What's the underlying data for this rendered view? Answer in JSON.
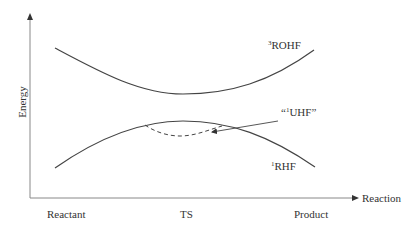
{
  "diagram": {
    "title": "",
    "y_axis": {
      "label": "Energy"
    },
    "x_axis": {
      "label": "Reaction",
      "ticks": [
        "Reactant",
        "TS",
        "Product"
      ]
    },
    "curves": [
      {
        "id": "rohf",
        "sup": "3",
        "name": "ROHF",
        "style": "solid",
        "shape": "upper curve with minimum at TS"
      },
      {
        "id": "rhf",
        "sup": "1",
        "name": "RHF",
        "style": "solid",
        "shape": "lower curve with maximum at TS"
      },
      {
        "id": "uhf",
        "sup": "1",
        "name": "UHF",
        "quote_open": "“",
        "quote_close": "”",
        "style": "dashed",
        "shape": "dip below RHF near TS"
      }
    ],
    "annotation_arrow": {
      "from_label": "“1UHF”",
      "points_to": "dashed UHF curve"
    },
    "colors": {
      "line": "#444444",
      "axis": "#888888",
      "text": "#333333",
      "background": "#ffffff"
    }
  }
}
